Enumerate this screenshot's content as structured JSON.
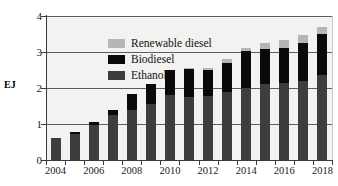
{
  "chart_data": {
    "type": "bar",
    "stacked": true,
    "title": "",
    "xlabel": "",
    "ylabel": "EJ",
    "ylim": [
      0,
      4
    ],
    "yticks": [
      0,
      1,
      2,
      3,
      4
    ],
    "grid": true,
    "legend_position": "upper-left-inside",
    "categories": [
      "2004",
      "2005",
      "2006",
      "2007",
      "2008",
      "2009",
      "2010",
      "2011",
      "2012",
      "2013",
      "2014",
      "2015",
      "2016",
      "2017",
      "2018"
    ],
    "tick_labels_shown": [
      "2004",
      "2006",
      "2008",
      "2010",
      "2012",
      "2014",
      "2016",
      "2018"
    ],
    "series": [
      {
        "name": "Ethanol",
        "color": "#3d3d3d",
        "values": [
          0.6,
          0.72,
          0.98,
          1.24,
          1.38,
          1.56,
          1.8,
          1.76,
          1.77,
          1.88,
          2.01,
          2.11,
          2.15,
          2.2,
          2.36
        ]
      },
      {
        "name": "Biodiesel",
        "color": "#0a0a0a",
        "values": [
          0.02,
          0.06,
          0.08,
          0.16,
          0.46,
          0.54,
          0.69,
          0.76,
          0.72,
          0.82,
          1.02,
          0.98,
          0.96,
          1.06,
          1.14
        ]
      },
      {
        "name": "Renewable diesel",
        "color": "#b6b6b6",
        "values": [
          0.0,
          0.0,
          0.0,
          0.0,
          0.0,
          0.02,
          0.02,
          0.04,
          0.06,
          0.12,
          0.09,
          0.17,
          0.22,
          0.22,
          0.2
        ]
      }
    ],
    "totals": [
      0.62,
      0.78,
      1.06,
      1.4,
      1.84,
      2.12,
      2.51,
      2.56,
      2.55,
      2.82,
      3.12,
      3.26,
      3.33,
      3.48,
      3.7
    ]
  },
  "legend": {
    "items": [
      {
        "label": "Renewable diesel",
        "color": "#b6b6b6"
      },
      {
        "label": "Biodiesel",
        "color": "#0a0a0a"
      },
      {
        "label": "Ethanol",
        "color": "#3d3d3d"
      }
    ]
  },
  "axis": {
    "y_title": "EJ"
  }
}
